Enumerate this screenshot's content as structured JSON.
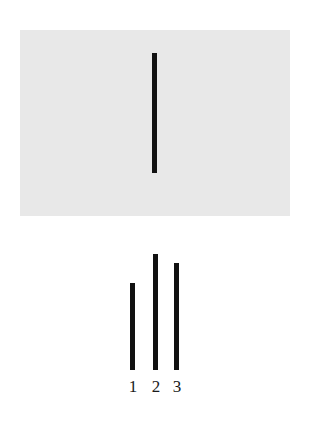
{
  "figure": {
    "name": "line-judgment-stimulus",
    "background_color": "#ffffff",
    "width": 310,
    "height": 432
  },
  "standard_card": {
    "name": "standard-line-card",
    "background_color": "#e8e8e8",
    "line": {
      "label": "standard",
      "color": "#111111",
      "length_px": 120,
      "thickness_px": 5
    }
  },
  "comparison_card": {
    "name": "comparison-lines-card",
    "background_color": "#ffffff",
    "lines": [
      {
        "label": "1",
        "color": "#111111",
        "length_px": 87,
        "thickness_px": 5
      },
      {
        "label": "2",
        "color": "#111111",
        "length_px": 116,
        "thickness_px": 5
      },
      {
        "label": "3",
        "color": "#111111",
        "length_px": 107,
        "thickness_px": 5
      }
    ]
  },
  "chart_data": {
    "type": "bar",
    "title": "",
    "subtitle": "",
    "xlabel": "",
    "ylabel": "",
    "orientation": "vertical",
    "grid": false,
    "legend": "none",
    "categories": [
      "standard",
      "1",
      "2",
      "3"
    ],
    "values": [
      120,
      87,
      116,
      107
    ],
    "tick_labels": [
      "1",
      "2",
      "3"
    ],
    "ylim": [
      0,
      130
    ],
    "annotations": [
      "Standard line shown alone on gray card",
      "Three comparison lines labeled 1, 2, 3 on white card"
    ]
  }
}
